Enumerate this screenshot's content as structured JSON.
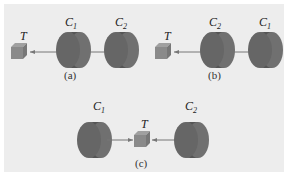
{
  "figure": {
    "panels": [
      {
        "id": "a",
        "caption": "(a)",
        "left_label": "C",
        "left_sub": "1",
        "right_label": "C",
        "right_sub": "2",
        "target": "T"
      },
      {
        "id": "b",
        "caption": "(b)",
        "left_label": "C",
        "left_sub": "2",
        "right_label": "C",
        "right_sub": "1",
        "target": "T"
      },
      {
        "id": "c",
        "caption": "(c)",
        "left_label": "C",
        "left_sub": "1",
        "right_label": "C",
        "right_sub": "2",
        "target": "T"
      }
    ],
    "colors": {
      "background": "#ededed",
      "cylinder": "#6b6b6b",
      "cylinder_dark": "#4a4a4a",
      "cube": "#8a8a8a",
      "line": "#777777"
    }
  }
}
